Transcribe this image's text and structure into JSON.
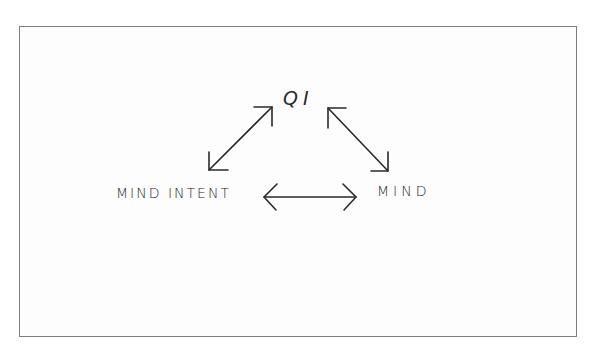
{
  "diagram": {
    "nodes": [
      {
        "id": "qi",
        "label": "QI"
      },
      {
        "id": "mind_intent",
        "label": "MIND INTENT"
      },
      {
        "id": "mind",
        "label": "MIND"
      }
    ],
    "edges": [
      {
        "from": "mind_intent",
        "to": "qi",
        "direction": "bidirectional"
      },
      {
        "from": "qi",
        "to": "mind",
        "direction": "bidirectional"
      },
      {
        "from": "mind_intent",
        "to": "mind",
        "direction": "bidirectional"
      }
    ],
    "colors": {
      "stroke": "#2a2a2a",
      "border": "#7d7d7d",
      "background": "#ffffff"
    }
  }
}
